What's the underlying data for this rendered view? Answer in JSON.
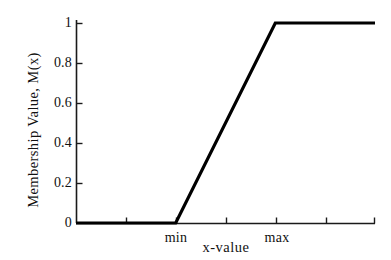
{
  "chart_data": {
    "type": "line",
    "title": "",
    "subtitle": "",
    "xlabel": "x-value",
    "ylabel": "Membership Value, M(x)",
    "xlim": [
      0,
      6
    ],
    "ylim": [
      0,
      1
    ],
    "grid": false,
    "legend": null,
    "line_color": "#000000",
    "axis_color": "#1a1a1a",
    "background_color": "#ffffff",
    "x_tick_positions": [
      0,
      1,
      2,
      3,
      4,
      5,
      6
    ],
    "x_tick_labels": [
      "",
      "",
      "min",
      "",
      "max",
      "",
      ""
    ],
    "y_ticks": [
      0,
      0.2,
      0.4,
      0.6,
      0.8,
      1
    ],
    "y_tick_labels": [
      "0",
      "0.2",
      "0.4",
      "0.6",
      "0.8",
      "1"
    ],
    "annotations": [
      {
        "text": "min",
        "x": 2,
        "y": 0
      },
      {
        "text": "max",
        "x": 4,
        "y": 1
      }
    ],
    "series": [
      {
        "name": "membership",
        "x": [
          0,
          2,
          4,
          6
        ],
        "values": [
          0,
          0,
          1,
          1
        ]
      }
    ]
  },
  "axis": {
    "y_title": "Membership Value, M(x)",
    "x_title": "x-value",
    "y_labels": [
      "1",
      "0.8",
      "0.6",
      "0.4",
      "0.2",
      "0"
    ],
    "x_labels": [
      "min",
      "max"
    ]
  }
}
